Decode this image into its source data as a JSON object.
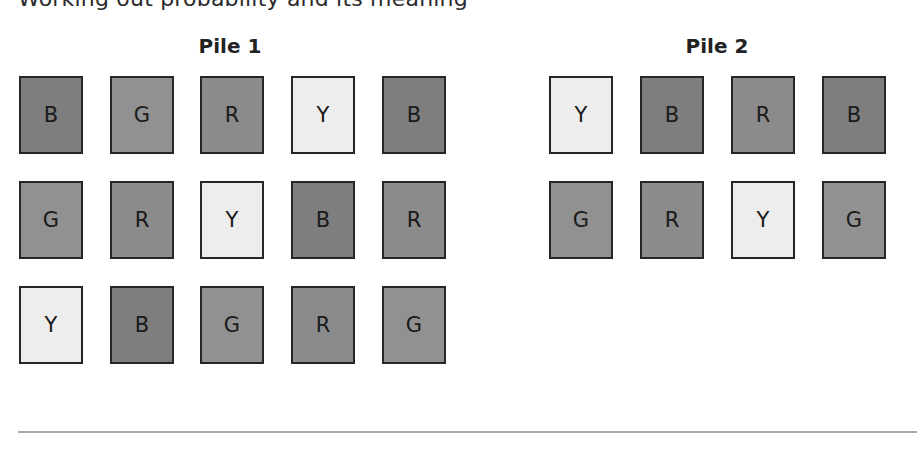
{
  "cut_off_text": "Working out probability and its meaning",
  "card_colors": {
    "B": "#7e7e7e",
    "G": "#919191",
    "R": "#8b8b8b",
    "Y": "#ededed"
  },
  "piles": [
    {
      "label": "Pile 1",
      "rows": [
        [
          "B",
          "G",
          "R",
          "Y",
          "B"
        ],
        [
          "G",
          "R",
          "Y",
          "B",
          "R"
        ],
        [
          "Y",
          "B",
          "G",
          "R",
          "G"
        ]
      ]
    },
    {
      "label": "Pile 2",
      "rows": [
        [
          "Y",
          "B",
          "R",
          "B"
        ],
        [
          "G",
          "R",
          "Y",
          "G"
        ]
      ]
    }
  ]
}
